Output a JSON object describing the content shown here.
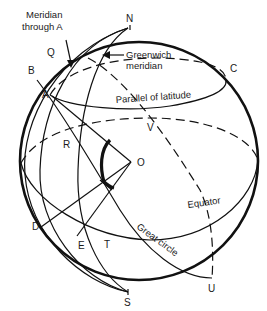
{
  "diagram": {
    "points": {
      "N": "N",
      "S": "S",
      "Q": "Q",
      "B": "B",
      "A": "A",
      "C": "C",
      "V": "V",
      "R": "R",
      "O": "O",
      "D": "D",
      "E": "E",
      "T": "T",
      "U": "U"
    },
    "annotations": {
      "meridian_a_line1": "Meridian",
      "meridian_a_line2": "through A",
      "greenwich_line1": "Greenwich",
      "greenwich_line2": "meridian",
      "parallel": "Parallel of latitude",
      "equator": "Equator",
      "great_circle": "Great circle"
    },
    "colors": {
      "ink": "#111111",
      "background": "#ffffff"
    }
  }
}
